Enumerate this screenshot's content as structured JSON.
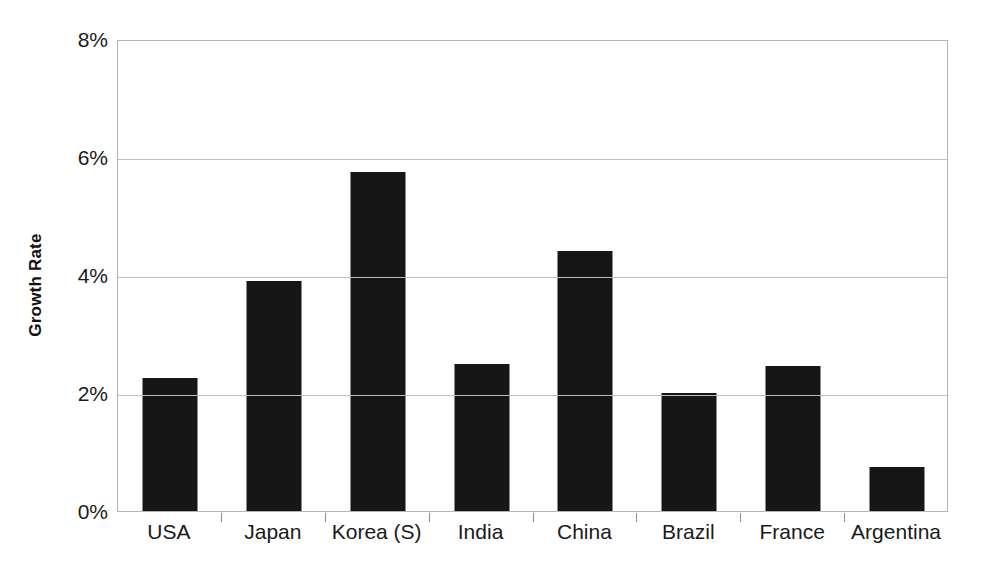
{
  "chart_data": {
    "type": "bar",
    "title": "",
    "subtitle": "",
    "xlabel": "",
    "ylabel": "Growth Rate",
    "categories": [
      "USA",
      "Japan",
      "Korea (S)",
      "India",
      "China",
      "Brazil",
      "France",
      "Argentina"
    ],
    "values": [
      2.25,
      3.9,
      5.75,
      2.5,
      4.4,
      2.0,
      2.45,
      0.75
    ],
    "value_unit": "%",
    "ylim": [
      0,
      8
    ],
    "ytick_labels": [
      "0%",
      "2%",
      "4%",
      "6%",
      "8%"
    ],
    "ytick_values": [
      0,
      2,
      4,
      6,
      8
    ],
    "grid": true,
    "legend": "none",
    "series": [
      {
        "name": "Growth Rate",
        "color": "#161616",
        "values": [
          2.25,
          3.9,
          5.75,
          2.5,
          4.4,
          2.0,
          2.45,
          0.75
        ]
      }
    ]
  },
  "style": {
    "bar_color": "#161616",
    "grid_color": "#bdbdbd",
    "border_color": "#b4b4b4",
    "text_color": "#1a1a1a",
    "background": "#ffffff"
  }
}
